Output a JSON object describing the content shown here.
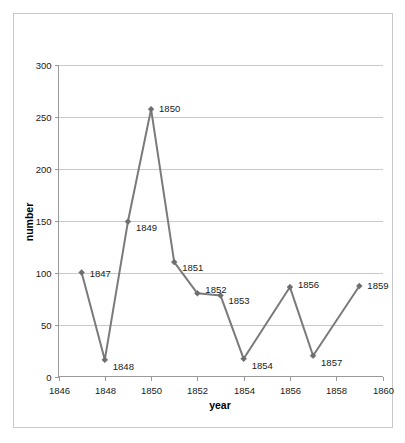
{
  "chart_data": {
    "type": "line",
    "title": "",
    "xlabel": "year",
    "ylabel": "number",
    "xlim": [
      1846,
      1860
    ],
    "ylim": [
      0,
      300
    ],
    "grid": true,
    "legend": "none",
    "x_ticks": [
      "1846",
      "1848",
      "1850",
      "1852",
      "1854",
      "1856",
      "1858",
      "1860"
    ],
    "x_tick_values": [
      1846,
      1848,
      1850,
      1852,
      1854,
      1856,
      1858,
      1860
    ],
    "y_ticks": [
      "0",
      "50",
      "100",
      "150",
      "200",
      "250",
      "300"
    ],
    "y_tick_values": [
      0,
      50,
      100,
      150,
      200,
      250,
      300
    ],
    "x": [
      1847,
      1848,
      1849,
      1850,
      1851,
      1852,
      1853,
      1854,
      1856,
      1857,
      1859
    ],
    "values": [
      100,
      16,
      149,
      257,
      110,
      80,
      78,
      17,
      86,
      20,
      87
    ],
    "point_labels": [
      "1847",
      "1848",
      "1849",
      "1850",
      "1851",
      "1852",
      "1853",
      "1854",
      "1856",
      "1857",
      "1859"
    ],
    "annotations": [
      {
        "label": "1847",
        "x": 1847,
        "y": 100
      },
      {
        "label": "1848",
        "x": 1848,
        "y": 16
      },
      {
        "label": "1849",
        "x": 1849,
        "y": 149
      },
      {
        "label": "1850",
        "x": 1850,
        "y": 257
      },
      {
        "label": "1851",
        "x": 1851,
        "y": 110
      },
      {
        "label": "1852",
        "x": 1852,
        "y": 80
      },
      {
        "label": "1853",
        "x": 1853,
        "y": 78
      },
      {
        "label": "1854",
        "x": 1854,
        "y": 17
      },
      {
        "label": "1856",
        "x": 1856,
        "y": 86
      },
      {
        "label": "1857",
        "x": 1857,
        "y": 20
      },
      {
        "label": "1859",
        "x": 1859,
        "y": 87
      }
    ],
    "colors": {
      "series": "#7a7a7a",
      "marker": "#6e6e6e",
      "grid": "#c9c9c9",
      "axis": "#9a9a9a",
      "background": "#ffffff",
      "border": "#c8c8c8",
      "text": "#1a1a1a"
    }
  }
}
